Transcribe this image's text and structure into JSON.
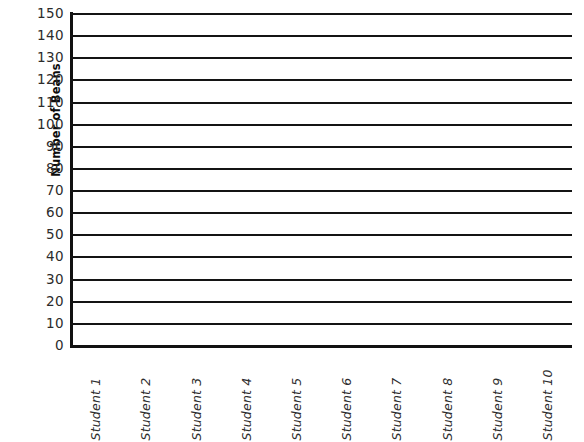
{
  "chart_data": {
    "type": "bar",
    "title": "",
    "subtitle": "",
    "xlabel": "",
    "ylabel": "Number of Beans",
    "categories": [
      "Student 1",
      "Student 2",
      "Student 3",
      "Student 4",
      "Student 5",
      "Student 6",
      "Student 7",
      "Student 8",
      "Student 9",
      "Student 10"
    ],
    "values": [
      null,
      null,
      null,
      null,
      null,
      null,
      null,
      null,
      null,
      null
    ],
    "ylim": [
      0,
      150
    ],
    "ytick_step": 10,
    "ytick_labels": [
      "150",
      "140",
      "130",
      "120",
      "110",
      "100",
      "90",
      "80",
      "70",
      "60",
      "50",
      "40",
      "30",
      "20",
      "10",
      "0"
    ],
    "ytick_values": [
      150,
      140,
      130,
      120,
      110,
      100,
      90,
      80,
      70,
      60,
      50,
      40,
      30,
      20,
      10,
      0
    ],
    "grid": true,
    "grid_orientation": "horizontal",
    "legend": null,
    "legend_position": "none",
    "annotations": [],
    "colors": {
      "gridline": "#141414",
      "axis": "#111111",
      "tick_label": "#2b2b2b",
      "axis_title": "#0d0d0d",
      "background": "#ffffff"
    }
  }
}
